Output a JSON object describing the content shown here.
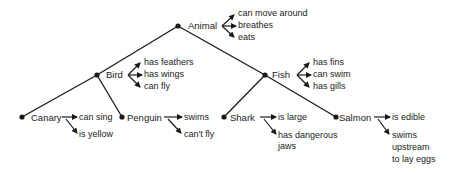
{
  "diagram": {
    "type": "semantic-network-hierarchy",
    "nodes": [
      {
        "id": "animal",
        "label": "Animal",
        "properties": [
          "can move around",
          "breathes",
          "eats"
        ]
      },
      {
        "id": "bird",
        "label": "Bird",
        "parent": "animal",
        "properties": [
          "has feathers",
          "has wings",
          "can fly"
        ]
      },
      {
        "id": "fish",
        "label": "Fish",
        "parent": "animal",
        "properties": [
          "has fins",
          "can swim",
          "has gills"
        ]
      },
      {
        "id": "canary",
        "label": "Canary",
        "parent": "bird",
        "properties": [
          "can sing",
          "is yellow"
        ]
      },
      {
        "id": "penguin",
        "label": "Penguin",
        "parent": "bird",
        "properties": [
          "swims",
          "can't fly"
        ]
      },
      {
        "id": "shark",
        "label": "Shark",
        "parent": "fish",
        "properties": [
          "is large",
          "has dangerous jaws"
        ]
      },
      {
        "id": "salmon",
        "label": "Salmon",
        "parent": "fish",
        "properties": [
          "is edible",
          "swims upstream to lay eggs"
        ]
      }
    ]
  },
  "labels": {
    "animal": "Animal",
    "animal_p1": "can move around",
    "animal_p2": "breathes",
    "animal_p3": "eats",
    "bird": "Bird",
    "bird_p1": "has feathers",
    "bird_p2": "has wings",
    "bird_p3": "can fly",
    "fish": "Fish",
    "fish_p1": "has fins",
    "fish_p2": "can swim",
    "fish_p3": "has gills",
    "canary": "Canary",
    "canary_p1": "can sing",
    "canary_p2": "is yellow",
    "penguin": "Penguin",
    "penguin_p1": "swims",
    "penguin_p2": "can't fly",
    "shark": "Shark",
    "shark_p1": "is large",
    "shark_p2a": "has dangerous",
    "shark_p2b": "jaws",
    "salmon": "Salmon",
    "salmon_p1": "is edible",
    "salmon_p2a": "swims",
    "salmon_p2b": "upstream",
    "salmon_p2c": "to lay eggs"
  }
}
